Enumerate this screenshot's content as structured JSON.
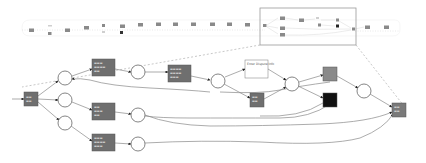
{
  "diagram": {
    "type": "petri-net-process-model",
    "overview": {
      "description": "Full process model thumbnail strip with highlighted zoom region",
      "transition_count": 24,
      "highlight_box": {
        "x": 260,
        "y": 8,
        "w": 96,
        "h": 37
      }
    },
    "detail": {
      "transitions": [
        {
          "id": "t_start",
          "label": "...",
          "fill": "#6f6f6f"
        },
        {
          "id": "t_top",
          "label": "...",
          "fill": "#6f6f6f"
        },
        {
          "id": "t_mid",
          "label": "...",
          "fill": "#6f6f6f"
        },
        {
          "id": "t_bottom",
          "label": "...",
          "fill": "#6f6f6f"
        },
        {
          "id": "t_seq",
          "label": "...",
          "fill": "#6f6f6f"
        },
        {
          "id": "t_white",
          "label": "Enter Dispute Info",
          "fill": "#ffffff"
        },
        {
          "id": "t_dark_mid",
          "label": "...",
          "fill": "#6f6f6f"
        },
        {
          "id": "t_gray_right",
          "label": "...",
          "fill": "#8a8a8a"
        },
        {
          "id": "t_black",
          "label": "",
          "fill": "#111111"
        },
        {
          "id": "t_end",
          "label": "...",
          "fill": "#7a7a7a"
        }
      ],
      "places": 9
    },
    "colors": {
      "transition": "#6f6f6f",
      "silent_transition": "#111111",
      "edge": "#888888",
      "arrow": "#222222",
      "dashed_connector": "#b0b0b0"
    }
  }
}
